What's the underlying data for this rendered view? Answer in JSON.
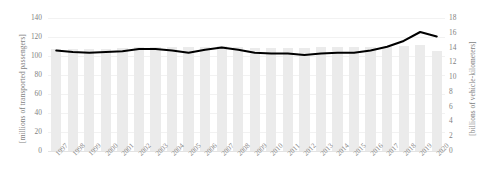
{
  "chart_data": {
    "type": "bar",
    "title": "",
    "subtitle": "",
    "xlabel": "",
    "ylabel": "[millions of transported passengers]",
    "y2label": "[billions of vehicle-kilometers]",
    "grid": true,
    "legend": "none",
    "categories": [
      "1997",
      "1998",
      "1999",
      "2000",
      "2001",
      "2002",
      "2003",
      "2004",
      "2005",
      "2006",
      "2007",
      "2008",
      "2009",
      "2010",
      "2011",
      "2012",
      "2013",
      "2014",
      "2015",
      "2016",
      "2017",
      "2018",
      "2019",
      "2020"
    ],
    "ylim": [
      0,
      140
    ],
    "y2lim": [
      0,
      18
    ],
    "yticks": [
      0,
      20,
      40,
      60,
      80,
      100,
      120,
      140
    ],
    "y2ticks": [
      0,
      2,
      4,
      6,
      8,
      10,
      12,
      14,
      16,
      18
    ],
    "series": [
      {
        "name": "transported passengers",
        "type": "bar",
        "axis": "left",
        "color": "#ebebeb",
        "values": [
          107,
          107,
          107,
          107,
          108,
          109,
          110,
          110,
          110,
          110,
          111,
          110,
          108,
          108,
          108,
          108,
          109,
          109,
          109,
          109,
          110,
          111,
          112,
          105
        ]
      },
      {
        "name": "vehicle-kilometers",
        "type": "line",
        "axis": "right",
        "color": "#000000",
        "values": [
          13.6,
          13.4,
          13.3,
          13.4,
          13.5,
          13.8,
          13.8,
          13.6,
          13.3,
          13.7,
          14.0,
          13.7,
          13.3,
          13.2,
          13.2,
          13.0,
          13.2,
          13.3,
          13.3,
          13.6,
          14.1,
          14.9,
          16.1,
          15.5
        ]
      }
    ]
  },
  "axes": {
    "left_title": "[millions of transported passengers]",
    "right_title": "[billions of vehicle-kilometers]"
  },
  "colors": {
    "bar": "#ebebeb",
    "line": "#000000",
    "tick_text": "#7f7f7f",
    "grid": "#f2f2f2",
    "background": "#ffffff"
  }
}
